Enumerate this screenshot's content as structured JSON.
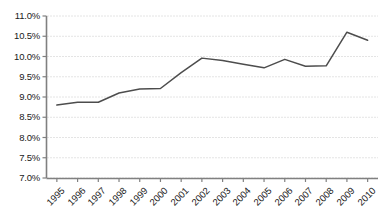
{
  "chart_data": {
    "type": "line",
    "title": "",
    "subtitle": "",
    "xlabel": "",
    "ylabel": "",
    "categories": [
      "1995",
      "1996",
      "1997",
      "1998",
      "1999",
      "2000",
      "2001",
      "2002",
      "2003",
      "2004",
      "2005",
      "2006",
      "2007",
      "2008",
      "2009",
      "2010"
    ],
    "values": [
      8.8,
      8.87,
      8.87,
      9.1,
      9.2,
      9.21,
      9.6,
      9.96,
      9.9,
      9.81,
      9.72,
      9.93,
      9.76,
      9.77,
      10.6,
      10.4
    ],
    "series": [
      {
        "name": "",
        "values": [
          8.8,
          8.87,
          8.87,
          9.1,
          9.2,
          9.21,
          9.6,
          9.96,
          9.9,
          9.81,
          9.72,
          9.93,
          9.76,
          9.77,
          10.6,
          10.4
        ]
      }
    ],
    "ylim": [
      7.0,
      11.0
    ],
    "ytick_values": [
      7.0,
      7.5,
      8.0,
      8.5,
      9.0,
      9.5,
      10.0,
      10.5,
      11.0
    ],
    "ytick_labels": [
      "7.0%",
      "7.5%",
      "8.0%",
      "8.5%",
      "9.0%",
      "9.5%",
      "10.0%",
      "10.5%",
      "11.0%"
    ],
    "xtick_labels": [
      "1995",
      "1996",
      "1997",
      "1998",
      "1999",
      "2000",
      "2001",
      "2002",
      "2003",
      "2004",
      "2005",
      "2006",
      "2007",
      "2008",
      "2009",
      "2010"
    ],
    "grid": true,
    "grid_style": "dotted-horizontal",
    "legend": false,
    "legend_position": "none",
    "annotations": [],
    "value_suffix": "%",
    "colors": {
      "line": "#4d4d4d",
      "axis": "#808080",
      "grid": "#c8c8c8",
      "text": "#1a1a1a",
      "background": "#ffffff"
    }
  }
}
